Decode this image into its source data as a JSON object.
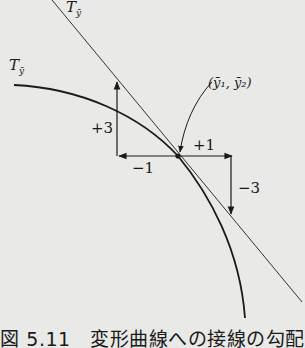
{
  "figure": {
    "caption": "図 5.11　変形曲線への接線の勾配",
    "labels": {
      "tangent_line": "T",
      "tangent_line_sub": "ȳ",
      "curve": "T",
      "curve_sub": "ȳ",
      "point": "(ȳ₁, ȳ₂)",
      "plus3": "+3",
      "minus1": "−1",
      "plus1": "+1",
      "minus3": "−3"
    },
    "colors": {
      "background": "#e9e9e7",
      "ink": "#1a1a1a"
    }
  }
}
